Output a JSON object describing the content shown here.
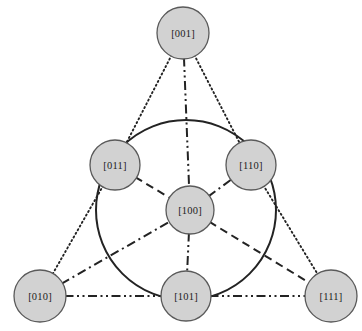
{
  "figure": {
    "title_fragment": "",
    "background_color": "#ffffff",
    "node_fill": "#d2d2d2",
    "node_stroke": "#5a5a5a",
    "line_color": "#232323",
    "label_color": "#1c1c1c"
  },
  "chart_data": {
    "type": "diagram",
    "title": "",
    "subtitle": "",
    "xlabel": "",
    "ylabel": "",
    "grid": false,
    "legend": "none",
    "nodes": [
      {
        "id": "n001",
        "label": "[001]",
        "x": 183,
        "y": 33,
        "r": 26,
        "role": "triangle-vertex-top"
      },
      {
        "id": "n011",
        "label": "[011]",
        "x": 115,
        "y": 165,
        "r": 25,
        "role": "circle-point-left"
      },
      {
        "id": "n110",
        "label": "[110]",
        "x": 251,
        "y": 165,
        "r": 25,
        "role": "circle-point-right"
      },
      {
        "id": "n100",
        "label": "[100]",
        "x": 190,
        "y": 210,
        "r": 24,
        "role": "center-pole"
      },
      {
        "id": "n010",
        "label": "[010]",
        "x": 40,
        "y": 296,
        "r": 26,
        "role": "triangle-vertex-bottom-left"
      },
      {
        "id": "n101",
        "label": "[101]",
        "x": 186,
        "y": 296,
        "r": 25,
        "role": "circle-point-bottom"
      },
      {
        "id": "n111",
        "label": "[111]",
        "x": 331,
        "y": 296,
        "r": 26,
        "role": "triangle-vertex-bottom-right"
      }
    ],
    "circle": {
      "cx": 186,
      "cy": 210,
      "r": 90,
      "style": "solid"
    },
    "edges": [
      {
        "from": "n001",
        "to": "n011",
        "style": "dotted",
        "name": "edge-001-011"
      },
      {
        "from": "n011",
        "to": "n010",
        "style": "dotted",
        "name": "edge-011-010"
      },
      {
        "from": "n001",
        "to": "n110",
        "style": "dotted",
        "name": "edge-001-110"
      },
      {
        "from": "n110",
        "to": "n111",
        "style": "dotted",
        "name": "edge-110-111"
      },
      {
        "from": "n001",
        "to": "n100",
        "style": "dash-dot-dot",
        "name": "edge-001-100"
      },
      {
        "from": "n100",
        "to": "n101",
        "style": "dash-dot-dot",
        "name": "edge-100-101"
      },
      {
        "from": "n010",
        "to": "n101",
        "style": "dash-dot-dot",
        "name": "edge-010-101"
      },
      {
        "from": "n101",
        "to": "n111",
        "style": "dash-dot-dot",
        "name": "edge-101-111"
      },
      {
        "from": "n011",
        "to": "n100",
        "style": "dashed",
        "name": "edge-011-100"
      },
      {
        "from": "n100",
        "to": "n111",
        "style": "dashed",
        "name": "edge-100-111"
      },
      {
        "from": "n010",
        "to": "n100",
        "style": "dash-dot",
        "name": "edge-010-100"
      },
      {
        "from": "n100",
        "to": "n110",
        "style": "dash-dot",
        "name": "edge-100-110"
      }
    ],
    "line_styles": {
      "solid": {
        "dasharray": "",
        "width": 2.0
      },
      "dotted": {
        "dasharray": "1.2 3.0",
        "width": 1.9
      },
      "dashed": {
        "dasharray": "8 5",
        "width": 2.0
      },
      "dash-dot": {
        "dasharray": "9 4 2 4",
        "width": 2.0
      },
      "dash-dot-dot": {
        "dasharray": "9 3.5 2 3.5 2 3.5",
        "width": 2.0
      }
    }
  }
}
